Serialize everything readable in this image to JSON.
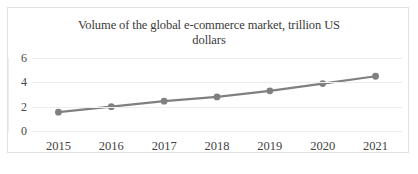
{
  "chart_data": {
    "type": "line",
    "title": "Volume of the global e-commerce market, trillion US dollars",
    "title_line1": "Volume of the global e-commerce market, trillion US",
    "title_line2": "dollars",
    "xlabel": "",
    "ylabel": "",
    "categories": [
      "2015",
      "2016",
      "2017",
      "2018",
      "2019",
      "2020",
      "2021"
    ],
    "values": [
      1.55,
      2.0,
      2.45,
      2.8,
      3.3,
      3.9,
      4.5
    ],
    "series": [
      {
        "name": "Volume of the global e-commerce market",
        "values": [
          1.55,
          2.0,
          2.45,
          2.8,
          3.3,
          3.9,
          4.5
        ]
      }
    ],
    "ylim": [
      0,
      6
    ],
    "yticks": [
      0,
      2,
      4,
      6
    ],
    "ytick_labels": [
      "0",
      "2",
      "4",
      "6"
    ],
    "grid": true,
    "legend": false,
    "legend_position": "none",
    "line_color": "#808080",
    "marker_color": "#808080",
    "grid_color": "#ededed",
    "border_color": "#e2e2e2",
    "background_color": "#ffffff"
  },
  "artifact": {
    "text": ""
  }
}
